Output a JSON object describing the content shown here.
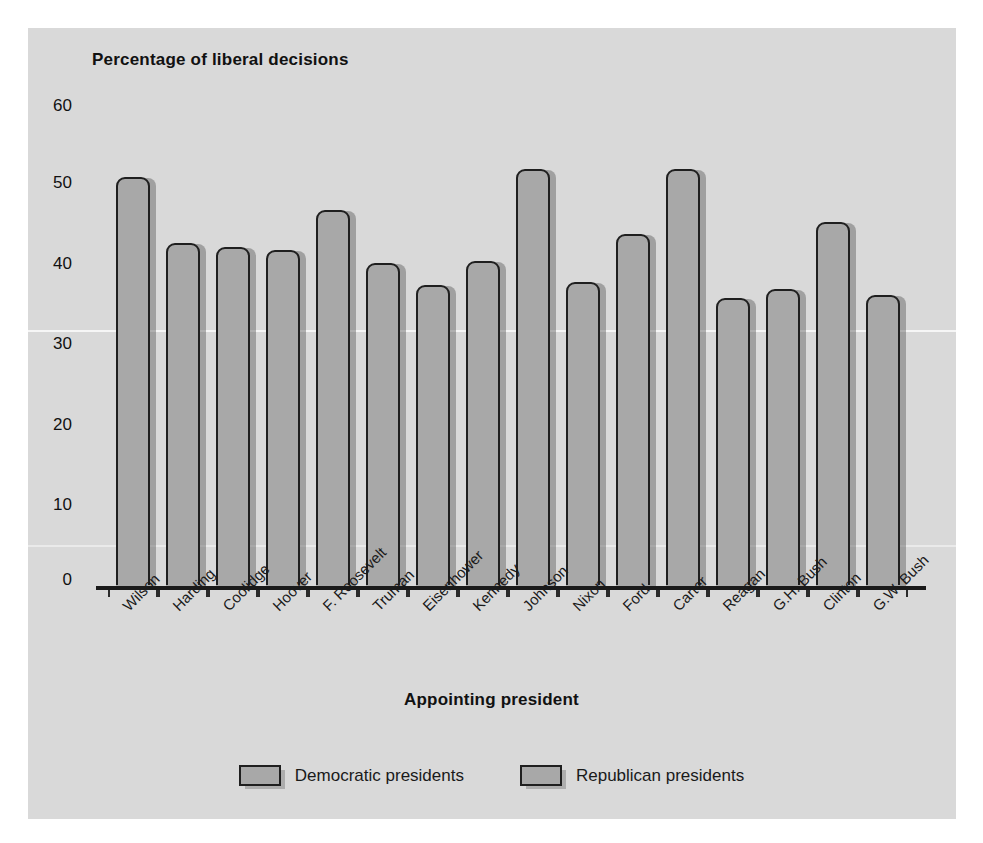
{
  "chart_data": {
    "type": "bar",
    "title": "",
    "ylabel": "Percentage of liberal decisions",
    "xlabel": "Appointing president",
    "ylim": [
      0,
      60
    ],
    "yticks": [
      0,
      10,
      20,
      30,
      40,
      50,
      60
    ],
    "grid": false,
    "legend_position": "bottom",
    "categories": [
      "Wilson",
      "Harding",
      "Coolidge",
      "Hoover",
      "F. Roosevelt",
      "Truman",
      "Eisenhower",
      "Kennedy",
      "Johnson",
      "Nixon",
      "Ford",
      "Carter",
      "Reagan",
      "G.H. Bush",
      "Clinton",
      "G.W. Bush"
    ],
    "values": [
      51,
      42.8,
      42.4,
      42,
      47,
      40.4,
      37.6,
      40.6,
      52,
      38,
      44,
      52,
      36,
      37.2,
      45.5,
      36.4
    ],
    "party": [
      "Democratic",
      "Republican",
      "Republican",
      "Republican",
      "Democratic",
      "Democratic",
      "Republican",
      "Democratic",
      "Democratic",
      "Republican",
      "Republican",
      "Democratic",
      "Republican",
      "Republican",
      "Democratic",
      "Republican"
    ],
    "legend": [
      {
        "label": "Democratic presidents",
        "color": "#a8a8a8"
      },
      {
        "label": "Republican presidents",
        "color": "#a8a8a8"
      }
    ],
    "colors": {
      "bar_fill": "#a8a8a8",
      "bar_outline": "#1f1f1f",
      "panel_background": "#d9d9d9",
      "text": "#111111"
    }
  }
}
